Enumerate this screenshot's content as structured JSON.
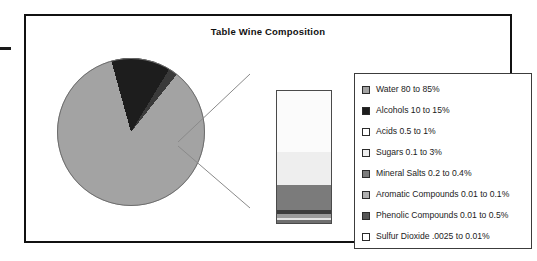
{
  "figure": {
    "title": "Table Wine Composition",
    "frame_color": "#111111",
    "background": "#ffffff"
  },
  "chart_data": {
    "type": "pie",
    "title": "Table Wine Composition",
    "xlabel": "",
    "ylabel": "",
    "legend_position": "right",
    "grid": false,
    "categories": [
      "Water 80 to 85%",
      "Alcohols 10 to 15%",
      "Acids 0.5 to 1%",
      "Sugars 0.1 to 3%",
      "Mineral Salts 0.2 to 0.4%",
      "Aromatic Compounds 0.01 to 0.1%",
      "Phenolic Compounds 0.01 to 0.5%",
      "Sulfur Dioxide .0025 to 0.01%"
    ],
    "values": [
      85,
      13,
      0.75,
      1.0,
      0.3,
      0.05,
      0.25,
      0.006
    ],
    "colors": [
      "#a3a3a3",
      "#1d1d1d",
      "#ffffff",
      "#ededed",
      "#7b7b7b",
      "#b0b0b0",
      "#565656",
      "#ffffff"
    ],
    "units": "percent of table wine by volume"
  },
  "pie": {
    "slices": [
      {
        "name": "Water",
        "label": "Water 80 to 85%",
        "value": 85,
        "color": "#a3a3a3"
      },
      {
        "name": "Alcohols",
        "label": "Alcohols 10 to 15%",
        "value": 13,
        "color": "#1d1d1d"
      },
      {
        "name": "Minor Constituents",
        "label": "Remaining trace constituents",
        "value": 2,
        "color": "#3a3a3a"
      }
    ],
    "outline_color": "#6d6d6d"
  },
  "detail_bar": {
    "name": "exploded-detail-bar",
    "border_color": "#4a4a4a",
    "segments": [
      {
        "name": "Acids",
        "label": "Acids 0.5 to 1%",
        "value": 0.75,
        "color": "#fbfbfb",
        "height_pct": 46
      },
      {
        "name": "Sugars",
        "label": "Sugars 0.1 to 3%",
        "value": 1.0,
        "color": "#eeeeee",
        "height_pct": 25
      },
      {
        "name": "Mineral Salts",
        "label": "Mineral Salts 0.2 to 0.4%",
        "value": 0.3,
        "color": "#7b7b7b",
        "height_pct": 19
      },
      {
        "name": "Phenolic Compounds",
        "label": "Phenolic Compounds 0.01 to 0.5%",
        "value": 0.25,
        "color": "#3c3c3c",
        "height_pct": 3
      },
      {
        "name": "Aromatic Compounds",
        "label": "Aromatic Compounds 0.01 to 0.1%",
        "value": 0.05,
        "color": "#9a9a9a",
        "height_pct": 3
      },
      {
        "name": "Sulfur Dioxide",
        "label": "Sulfur Dioxide .0025 to 0.01%",
        "value": 0.006,
        "color": "#e3e3e3",
        "height_pct": 2
      },
      {
        "name": "Base Band",
        "label": "",
        "value": 0,
        "color": "#6f6f6f",
        "height_pct": 2
      }
    ]
  },
  "legend": {
    "items": [
      {
        "label": "Water 80 to 85%",
        "color": "#a3a3a3",
        "swatch_name": "legend-swatch-water"
      },
      {
        "label": "Alcohols 10 to 15%",
        "color": "#1d1d1d",
        "swatch_name": "legend-swatch-alcohols"
      },
      {
        "label": "Acids 0.5 to 1%",
        "color": "#ffffff",
        "swatch_name": "legend-swatch-acids"
      },
      {
        "label": "Sugars 0.1 to 3%",
        "color": "#ededed",
        "swatch_name": "legend-swatch-sugars"
      },
      {
        "label": "Mineral Salts 0.2 to 0.4%",
        "color": "#7b7b7b",
        "swatch_name": "legend-swatch-mineral-salts"
      },
      {
        "label": "Aromatic Compounds 0.01 to 0.1%",
        "color": "#b0b0b0",
        "swatch_name": "legend-swatch-aromatic-compounds"
      },
      {
        "label": "Phenolic Compounds 0.01 to 0.5%",
        "color": "#565656",
        "swatch_name": "legend-swatch-phenolic-compounds"
      },
      {
        "label": "Sulfur Dioxide .0025 to 0.01%",
        "color": "#ffffff",
        "swatch_name": "legend-swatch-sulfur-dioxide"
      }
    ]
  }
}
